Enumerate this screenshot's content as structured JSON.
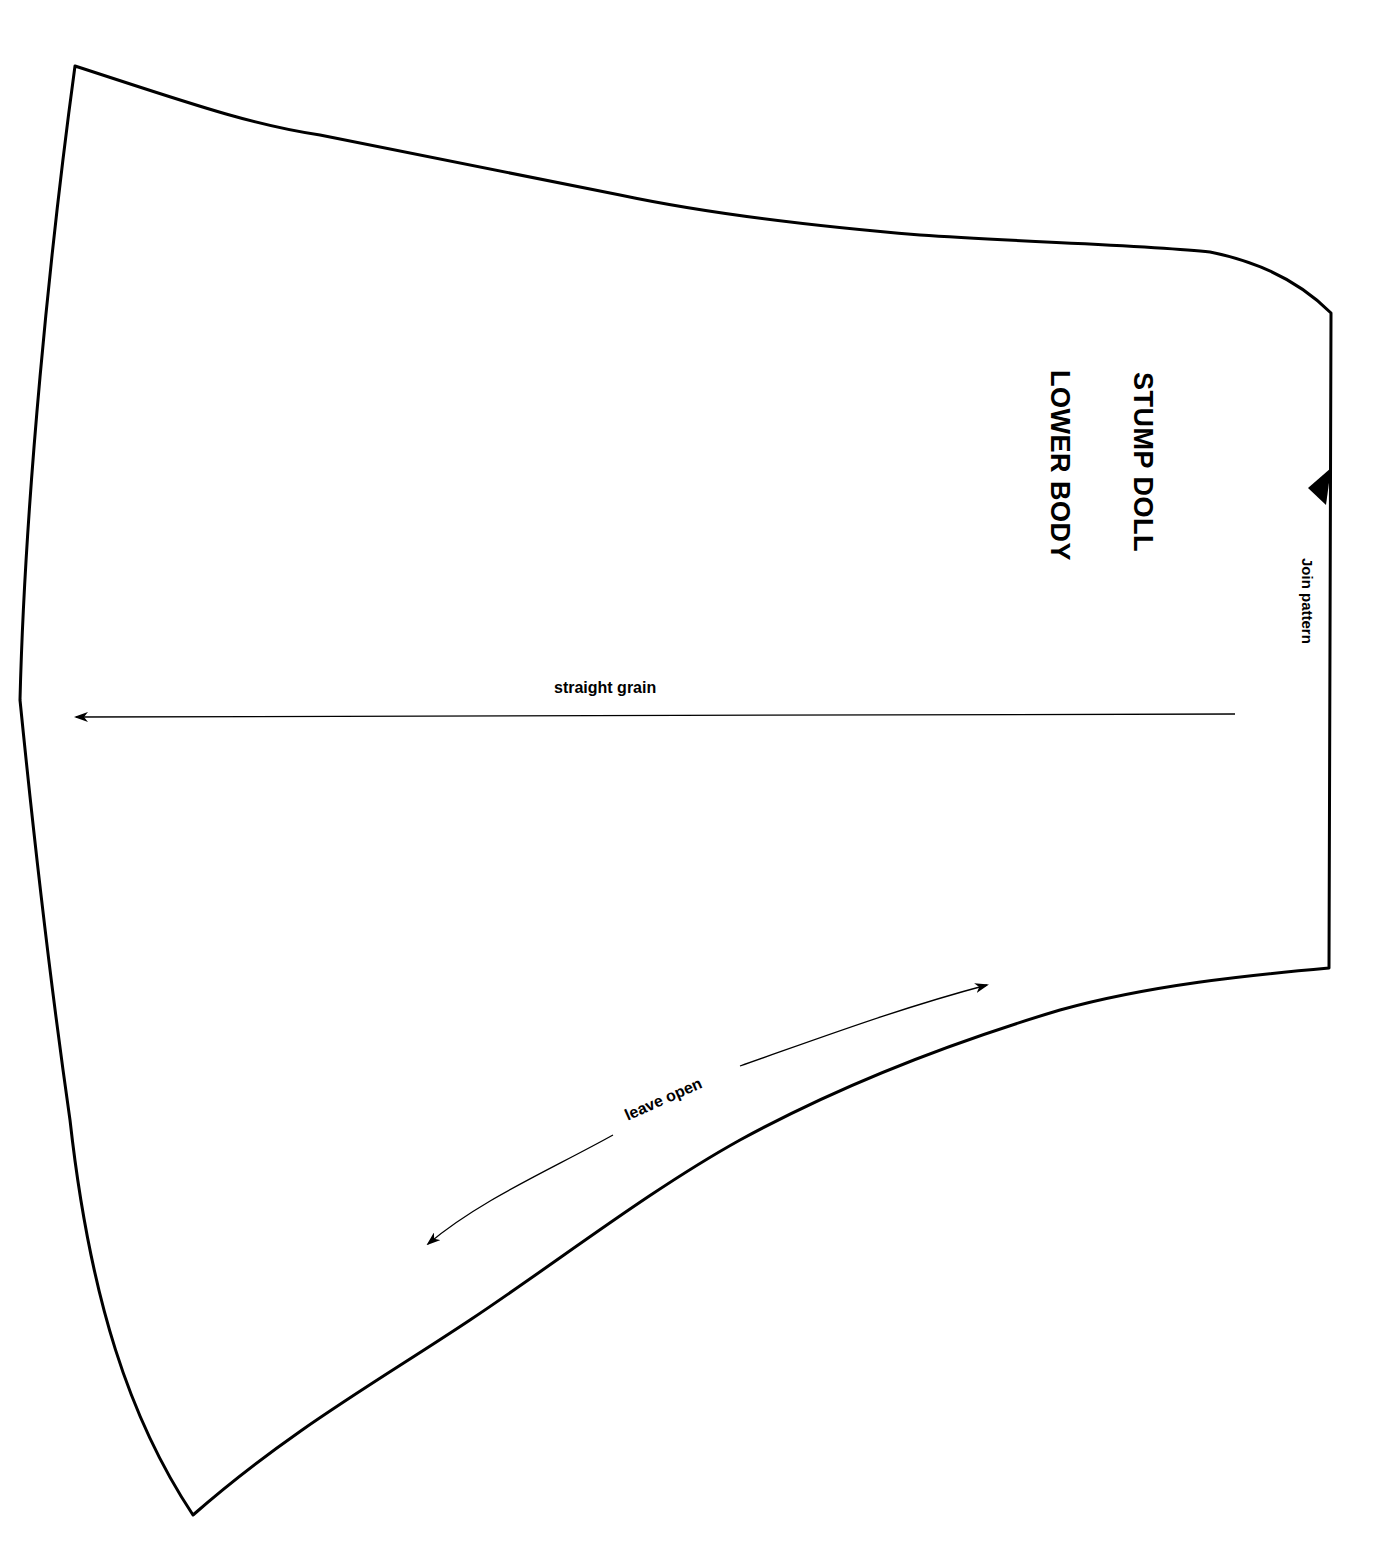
{
  "pattern": {
    "title_line_1": "STUMP DOLL",
    "title_line_2": "LOWER BODY",
    "annotations": {
      "join": "Join pattern",
      "grain": "straight grain",
      "opening": "leave open"
    },
    "colors": {
      "outline": "#000000",
      "background": "#ffffff"
    }
  }
}
